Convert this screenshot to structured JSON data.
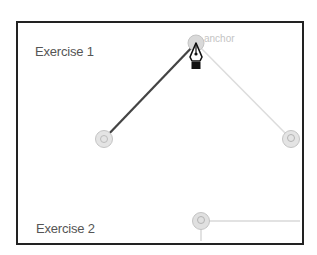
{
  "canvas": {
    "artboard_border_color": "#222222",
    "background": "#ffffff"
  },
  "labels": {
    "exercise_1": "Exercise 1",
    "exercise_2": "Exercise 2"
  },
  "tooltip": {
    "anchor_hint": "anchor"
  },
  "anchors": [
    {
      "name": "top-anchor",
      "x": 196,
      "y": 43
    },
    {
      "name": "left-anchor",
      "x": 104,
      "y": 139
    },
    {
      "name": "right-anchor",
      "x": 291,
      "y": 139
    },
    {
      "name": "bottom-anchor",
      "x": 201,
      "y": 221
    }
  ],
  "cursor": {
    "icon": "pen-tool-icon"
  },
  "colors": {
    "drawn_path": "#444444",
    "guide_path": "#d8d8d8",
    "anchor_fill": "#d6d6d6",
    "text": "#555555"
  }
}
